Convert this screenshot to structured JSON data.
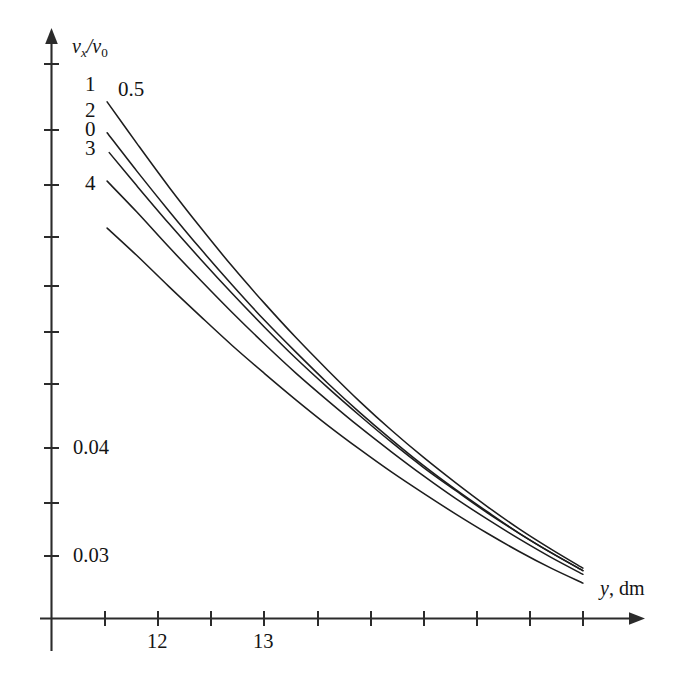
{
  "chart_data": {
    "type": "line",
    "title": "",
    "subtitle": "",
    "xlabel": "y, dm",
    "ylabel": "v_x/v_0",
    "xlabel_parts": {
      "symbol": "y",
      "unit": ", dm"
    },
    "ylabel_parts": {
      "num_symbol": "v",
      "num_sub": "x",
      "slash": "/",
      "den_symbol": "v",
      "den_sub": "0"
    },
    "xscale": "linear",
    "yscale": "log",
    "xlim": [
      11.5,
      16.5
    ],
    "ylim": [
      0.0275,
      0.125
    ],
    "grid": false,
    "legend": "inline-curve-labels",
    "legend_position": "left-of-curves",
    "x_ticks": [
      11.5,
      12.0,
      12.5,
      13.0,
      13.5,
      14.0,
      14.5,
      15.0,
      15.5,
      16.0,
      16.5
    ],
    "x_tick_labels": [
      "",
      "12",
      "",
      "13",
      "",
      "",
      "",
      "",
      "",
      "",
      ""
    ],
    "y_ticks": [
      0.03,
      0.035,
      0.04,
      0.05,
      0.06,
      0.07,
      0.08,
      0.09,
      0.1,
      0.11,
      0.12
    ],
    "y_tick_labels": [
      "0.03",
      "",
      "0.04",
      "",
      "",
      "",
      "",
      "",
      "",
      "",
      ""
    ],
    "annotations": [
      {
        "text": "0.5",
        "x": 12.15,
        "y": 0.108,
        "note": "curve parameter label for topmost curve"
      }
    ],
    "series": [
      {
        "name": "1",
        "label": "1",
        "label_x": 11.6,
        "label_y": 0.1095,
        "x": [
          11.52,
          11.8,
          12.1,
          12.4,
          12.7,
          13.0,
          13.3,
          13.6,
          13.9,
          14.2,
          14.5,
          14.8,
          15.1,
          15.4,
          15.7,
          16.0
        ],
        "y": [
          0.1073,
          0.0958,
          0.0851,
          0.0761,
          0.0684,
          0.0619,
          0.0563,
          0.0515,
          0.0473,
          0.0437,
          0.0406,
          0.0379,
          0.0355,
          0.0334,
          0.0316,
          0.03
        ]
      },
      {
        "name": "2",
        "label": "2",
        "label_x": 11.6,
        "label_y": 0.0995,
        "x": [
          11.52,
          11.8,
          12.1,
          12.4,
          12.7,
          13.0,
          13.3,
          13.6,
          13.9,
          14.2,
          14.5,
          14.8,
          15.1,
          15.4,
          15.7,
          16.0
        ],
        "y": [
          0.0986,
          0.0888,
          0.0797,
          0.0718,
          0.065,
          0.0591,
          0.0541,
          0.0497,
          0.0459,
          0.0426,
          0.0397,
          0.0372,
          0.035,
          0.033,
          0.0313,
          0.0298
        ]
      },
      {
        "name": "0",
        "label": "0",
        "label_x": 11.6,
        "label_y": 0.0935,
        "x": [
          11.54,
          11.8,
          12.1,
          12.4,
          12.7,
          13.0,
          13.3,
          13.6,
          13.9,
          14.2,
          14.5,
          14.8,
          15.1,
          15.4,
          15.7,
          16.0
        ],
        "y": [
          0.0934,
          0.0853,
          0.077,
          0.0698,
          0.0635,
          0.058,
          0.0532,
          0.0491,
          0.0455,
          0.0423,
          0.0395,
          0.0371,
          0.0349,
          0.033,
          0.0313,
          0.0298
        ]
      },
      {
        "name": "3",
        "label": "3",
        "label_x": 11.6,
        "label_y": 0.0868,
        "x": [
          11.52,
          11.8,
          12.1,
          12.4,
          12.7,
          13.0,
          13.3,
          13.6,
          13.9,
          14.2,
          14.5,
          14.8,
          15.1,
          15.4,
          15.7,
          16.0
        ],
        "y": [
          0.0864,
          0.0794,
          0.0722,
          0.0659,
          0.0603,
          0.0554,
          0.0511,
          0.0474,
          0.0441,
          0.0412,
          0.0386,
          0.0363,
          0.0343,
          0.0325,
          0.0309,
          0.0295
        ]
      },
      {
        "name": "4",
        "label": "4",
        "label_x": 11.6,
        "label_y": 0.0763,
        "x": [
          11.52,
          11.8,
          12.1,
          12.4,
          12.7,
          13.0,
          13.3,
          13.6,
          13.9,
          14.2,
          14.5,
          14.8,
          15.1,
          15.4,
          15.7,
          16.0
        ],
        "y": [
          0.076,
          0.0705,
          0.0648,
          0.0597,
          0.0551,
          0.0511,
          0.0475,
          0.0443,
          0.0415,
          0.039,
          0.0368,
          0.0348,
          0.033,
          0.0314,
          0.03,
          0.0288
        ]
      }
    ]
  },
  "axes": {
    "y_axis_name": "vertical-axis",
    "x_axis_name": "horizontal-axis"
  },
  "colors": {
    "curve": "#1d1d1d",
    "axis": "#2b2b2b",
    "text": "#141414",
    "background": "#ffffff"
  }
}
